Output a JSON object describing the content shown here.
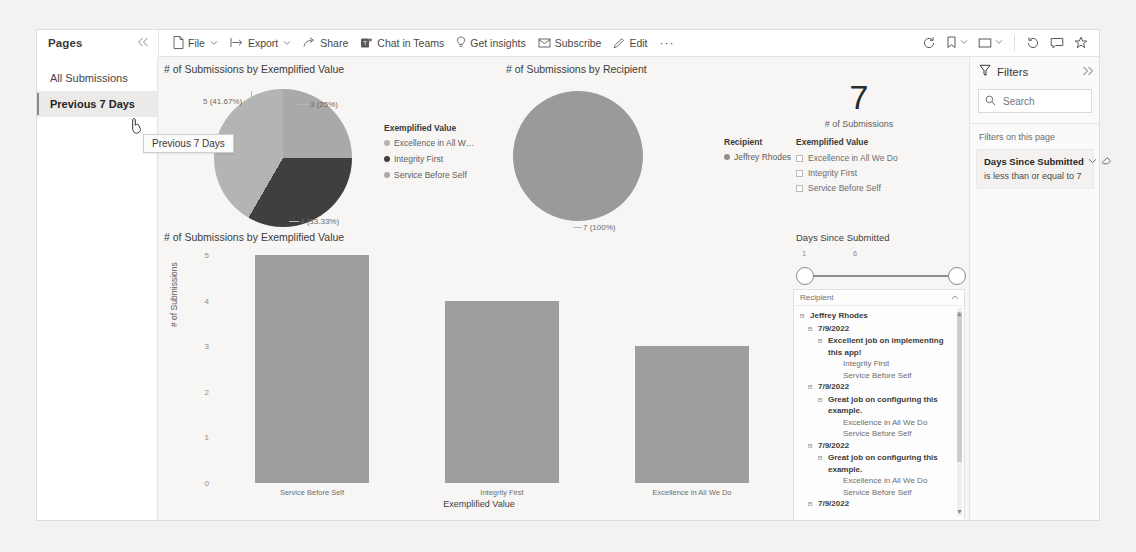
{
  "pages_pane": {
    "title": "Pages",
    "collapse_icon": "chevron-double-left-icon",
    "items": [
      {
        "label": "All Submissions",
        "selected": false
      },
      {
        "label": "Previous 7 Days",
        "selected": true
      }
    ],
    "tooltip": "Previous 7 Days"
  },
  "toolbar": {
    "items": [
      {
        "label": "File",
        "icon": "file-icon",
        "has_chevron": true
      },
      {
        "label": "Export",
        "icon": "export-icon",
        "has_chevron": true
      },
      {
        "label": "Share",
        "icon": "share-icon",
        "has_chevron": false
      },
      {
        "label": "Chat in Teams",
        "icon": "teams-icon",
        "has_chevron": false
      },
      {
        "label": "Get insights",
        "icon": "lightbulb-icon",
        "has_chevron": false
      },
      {
        "label": "Subscribe",
        "icon": "mail-icon",
        "has_chevron": false
      },
      {
        "label": "Edit",
        "icon": "pencil-icon",
        "has_chevron": false
      }
    ],
    "more_label": "···",
    "right_icons": [
      {
        "name": "reset-icon",
        "has_chevron": false
      },
      {
        "name": "bookmark-icon",
        "has_chevron": true
      },
      {
        "name": "view-icon",
        "has_chevron": true
      },
      {
        "name": "refresh-icon",
        "has_chevron": false
      },
      {
        "name": "comment-icon",
        "has_chevron": false
      },
      {
        "name": "favorite-star-icon",
        "has_chevron": false
      }
    ]
  },
  "visuals": {
    "pie_exemplified": {
      "title": "# of Submissions by Exemplified Value",
      "labels": [
        {
          "text": "5 (41.67%)"
        },
        {
          "text": "3 (25%)"
        },
        {
          "text": "4 (33.33%)"
        }
      ],
      "legend_title": "Exemplified Value",
      "legend_items": [
        {
          "label": "Excellence in All W…",
          "color": "#b4b4b4"
        },
        {
          "label": "Integrity First",
          "color": "#3f3f3f"
        },
        {
          "label": "Service Before Self",
          "color": "#a9a9a9"
        }
      ]
    },
    "pie_recipient": {
      "title": "# of Submissions by Recipient",
      "labels": [
        {
          "text": "7 (100%)"
        }
      ],
      "legend_title": "Recipient",
      "legend_items": [
        {
          "label": "Jeffrey Rhodes",
          "color": "#8f8f8f"
        }
      ]
    },
    "kpi": {
      "value": "7",
      "label": "# of Submissions"
    },
    "exemplified_filter": {
      "title": "Exemplified Value",
      "options": [
        "Excellence in All We Do",
        "Integrity First",
        "Service Before Self"
      ]
    },
    "days_slider": {
      "title": "Days Since Submitted",
      "min_tick": "1",
      "max_tick": "6"
    },
    "tree": {
      "column_header": "Recipient",
      "collapse_icon": "chevron-up-icon",
      "rows": [
        {
          "level": 1,
          "label": "Jeffrey Rhodes",
          "bold": true,
          "expander": "⊟"
        },
        {
          "level": 2,
          "label": "7/9/2022",
          "bold": true,
          "expander": "⊟"
        },
        {
          "level": 3,
          "label": "Excellent job on implementing this app!",
          "bold": true,
          "expander": "⊟"
        },
        {
          "level": 4,
          "label": "Integrity First",
          "bold": false,
          "expander": ""
        },
        {
          "level": 4,
          "label": "Service Before Self",
          "bold": false,
          "expander": ""
        },
        {
          "level": 2,
          "label": "7/9/2022",
          "bold": true,
          "expander": "⊟"
        },
        {
          "level": 3,
          "label": "Great job on configuring this example.",
          "bold": true,
          "expander": "⊟"
        },
        {
          "level": 4,
          "label": "Excellence in All We Do",
          "bold": false,
          "expander": ""
        },
        {
          "level": 4,
          "label": "Service Before Self",
          "bold": false,
          "expander": ""
        },
        {
          "level": 2,
          "label": "7/9/2022",
          "bold": true,
          "expander": "⊟"
        },
        {
          "level": 3,
          "label": "Great job on configuring this example.",
          "bold": true,
          "expander": "⊟"
        },
        {
          "level": 4,
          "label": "Excellence in All We Do",
          "bold": false,
          "expander": ""
        },
        {
          "level": 4,
          "label": "Service Before Self",
          "bold": false,
          "expander": ""
        },
        {
          "level": 2,
          "label": "7/9/2022",
          "bold": true,
          "expander": "⊟"
        }
      ]
    }
  },
  "filters_pane": {
    "title": "Filters",
    "filter_icon": "funnel-icon",
    "expand_icon": "chevron-double-right-icon",
    "search_placeholder": "Search",
    "search_value": "",
    "section_label": "Filters on this page",
    "cards": [
      {
        "name": "Days Since Submitted",
        "description": "is less than or equal to 7",
        "chevron": "chevron-down-icon",
        "eraser": "clear-filter-icon"
      }
    ]
  },
  "chart_data": {
    "type": "bar",
    "title": "# of Submissions by Exemplified Value",
    "categories": [
      "Service Before Self",
      "Integrity First",
      "Excellence in All We Do"
    ],
    "values": [
      5,
      4,
      3
    ],
    "xlabel": "Exemplified Value",
    "ylabel": "# of Submissions",
    "yticks": [
      "0",
      "1",
      "2",
      "3",
      "4",
      "5"
    ],
    "ylim": [
      0,
      5
    ],
    "grid": false,
    "bar_color": "#9e9e9e"
  },
  "chart_data_pies": [
    {
      "type": "pie",
      "title": "# of Submissions by Exemplified Value",
      "categories": [
        "Service Before Self",
        "Integrity First",
        "Excellence in All We Do"
      ],
      "values": [
        5,
        4,
        3
      ],
      "labels": [
        "5 (41.67%)",
        "4 (33.33%)",
        "3 (25%)"
      ],
      "legend_position": "right"
    },
    {
      "type": "pie",
      "title": "# of Submissions by Recipient",
      "categories": [
        "Jeffrey Rhodes"
      ],
      "values": [
        7
      ],
      "labels": [
        "7 (100%)"
      ],
      "legend_position": "right"
    }
  ]
}
